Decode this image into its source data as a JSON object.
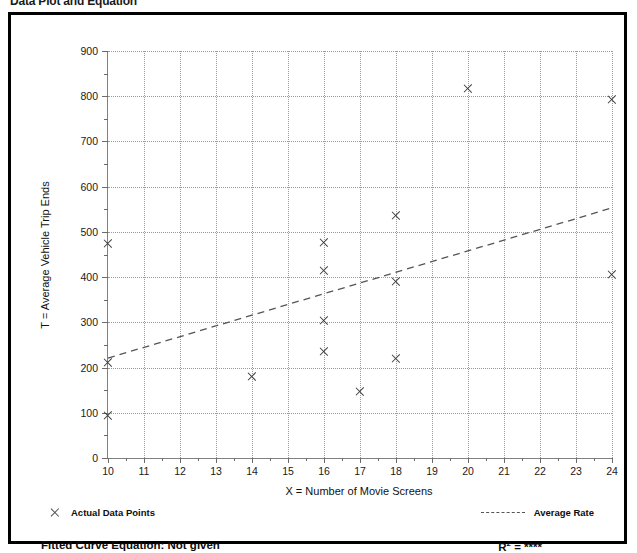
{
  "page_title": "Data Plot and Equation",
  "chart_data": {
    "type": "scatter",
    "title": "Data Plot and Equation",
    "xlabel": "X = Number of Movie Screens",
    "ylabel": "T = Average Vehicle Trip Ends",
    "xlim": [
      10,
      24
    ],
    "ylim": [
      0,
      900
    ],
    "x_ticks": [
      10,
      11,
      12,
      13,
      14,
      15,
      16,
      17,
      18,
      19,
      20,
      21,
      22,
      23,
      24
    ],
    "y_ticks": [
      0,
      100,
      200,
      300,
      400,
      500,
      600,
      700,
      800,
      900
    ],
    "y_minor_step": 50,
    "grid": true,
    "legend_position": "below-axes",
    "series": [
      {
        "name": "Actual Data Points",
        "marker": "x",
        "points": [
          {
            "x": 10,
            "y": 475
          },
          {
            "x": 10,
            "y": 212
          },
          {
            "x": 10,
            "y": 95
          },
          {
            "x": 14,
            "y": 180
          },
          {
            "x": 16,
            "y": 476
          },
          {
            "x": 16,
            "y": 415
          },
          {
            "x": 16,
            "y": 305
          },
          {
            "x": 16,
            "y": 235
          },
          {
            "x": 17,
            "y": 147
          },
          {
            "x": 18,
            "y": 537
          },
          {
            "x": 18,
            "y": 390
          },
          {
            "x": 18,
            "y": 220
          },
          {
            "x": 20,
            "y": 818
          },
          {
            "x": 24,
            "y": 793
          },
          {
            "x": 24,
            "y": 406
          }
        ]
      },
      {
        "name": "Average Rate",
        "style": "dashed-line",
        "points": [
          {
            "x": 10,
            "y": 221
          },
          {
            "x": 24,
            "y": 553
          }
        ]
      }
    ],
    "annotations": {
      "fitted_curve_equation": "Fitted Curve Equation:  Not given",
      "r_squared": "R2 = ****"
    }
  },
  "axes": {
    "y_title": "T = Average Vehicle Trip Ends",
    "x_title": "X = Number of Movie Screens",
    "y_tick_labels": [
      "900",
      "800",
      "700",
      "600",
      "500",
      "400",
      "300",
      "200",
      "100",
      "0"
    ],
    "x_tick_labels": [
      "10",
      "11",
      "12",
      "13",
      "14",
      "15",
      "16",
      "17",
      "18",
      "19",
      "20",
      "21",
      "22",
      "23",
      "24"
    ]
  },
  "legend": {
    "data_points_label": "Actual Data Points",
    "average_rate_label": "Average Rate"
  },
  "footer": {
    "fitted_curve_label": "Fitted Curve Equation:  Not given",
    "r_squared_prefix": "R",
    "r_squared_exponent": "2",
    "r_squared_value": " = ****"
  },
  "colors": {
    "marker": "#3c3c3c",
    "grid": "#9a9a9a",
    "axis": "#808080",
    "frame": "#000000",
    "trend": "#555555"
  }
}
